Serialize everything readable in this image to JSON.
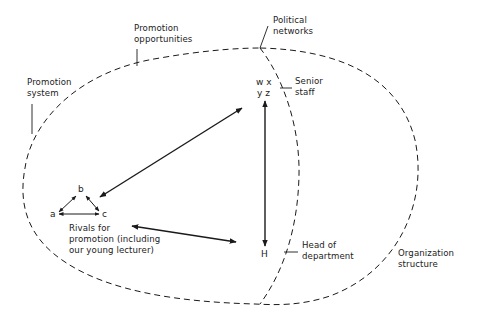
{
  "diagram": {
    "type": "nested-systems-diagram",
    "colors": {
      "ink": "#1a1a1a",
      "background": "#ffffff"
    },
    "labels": {
      "promotion_opportunities": [
        "Promotion",
        "opportunities"
      ],
      "political_networks": [
        "Political",
        "networks"
      ],
      "promotion_system": [
        "Promotion",
        "system"
      ],
      "senior_staff": [
        "Senior",
        "staff"
      ],
      "head_of_department": [
        "Head of",
        "department"
      ],
      "organization_structure": [
        "Organization",
        "structure"
      ],
      "rivals": [
        "Rivals for",
        "promotion (including",
        "our young lecturer)"
      ]
    },
    "nodes": {
      "a": "a",
      "b": "b",
      "c": "c",
      "senior_row1": "w x",
      "senior_row2": "y z",
      "head": "H"
    },
    "edges": [
      {
        "from": "a",
        "to": "b",
        "type": "bidirectional"
      },
      {
        "from": "b",
        "to": "c",
        "type": "bidirectional"
      },
      {
        "from": "a",
        "to": "c",
        "type": "bidirectional"
      },
      {
        "from": "rivals",
        "to": "senior staff",
        "type": "bidirectional"
      },
      {
        "from": "rivals",
        "to": "H",
        "type": "bidirectional"
      },
      {
        "from": "H",
        "to": "senior staff",
        "type": "bidirectional"
      }
    ],
    "regions": [
      "Promotion system (outer dashed ellipse)",
      "Political networks (inner dashed curve)",
      "Organization structure"
    ]
  }
}
